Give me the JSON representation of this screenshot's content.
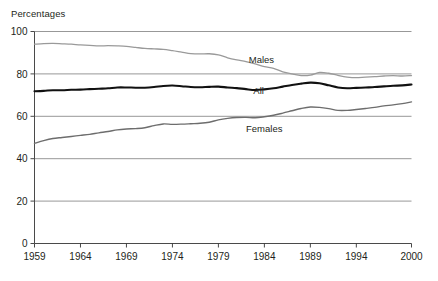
{
  "chart_data": {
    "type": "line",
    "title": "",
    "subtitle": "",
    "ylabel": "Percentages",
    "xlabel": "",
    "ylim": [
      0,
      100
    ],
    "xlim": [
      1959,
      2000
    ],
    "yticks": [
      0,
      20,
      40,
      60,
      80,
      100
    ],
    "ytick_labels": [
      "0",
      "20",
      "40",
      "60",
      "80",
      "100"
    ],
    "xticks": [
      1959,
      1964,
      1969,
      1974,
      1979,
      1984,
      1989,
      1994,
      2000
    ],
    "xtick_labels": [
      "1959",
      "1964",
      "1969",
      "1974",
      "1979",
      "1984",
      "1989",
      "1994",
      "2000"
    ],
    "grid": "horizontal",
    "legend": "inline-labels",
    "x": [
      1959,
      1960,
      1961,
      1962,
      1963,
      1964,
      1965,
      1966,
      1967,
      1968,
      1969,
      1970,
      1971,
      1972,
      1973,
      1974,
      1975,
      1976,
      1977,
      1978,
      1979,
      1980,
      1981,
      1982,
      1983,
      1984,
      1985,
      1986,
      1987,
      1988,
      1989,
      1990,
      1991,
      1992,
      1993,
      1994,
      1995,
      1996,
      1997,
      1998,
      1999,
      2000
    ],
    "series": [
      {
        "name": "Males",
        "color": "#9a9a9a",
        "width": 1.3,
        "values": [
          94.0,
          94.3,
          94.4,
          94.2,
          94.0,
          93.7,
          93.5,
          93.2,
          93.3,
          93.2,
          93.0,
          92.5,
          92.0,
          91.8,
          91.6,
          91.0,
          90.3,
          89.6,
          89.4,
          89.5,
          89.0,
          87.6,
          86.6,
          85.8,
          84.7,
          83.4,
          82.6,
          81.0,
          80.0,
          79.2,
          79.4,
          80.7,
          80.3,
          79.3,
          78.5,
          78.2,
          78.5,
          78.7,
          79.0,
          79.2,
          79.0,
          79.2
        ]
      },
      {
        "name": "All",
        "color": "#111111",
        "width": 2.1,
        "values": [
          71.8,
          72.0,
          72.3,
          72.3,
          72.5,
          72.6,
          72.8,
          73.0,
          73.2,
          73.6,
          73.6,
          73.5,
          73.5,
          73.8,
          74.3,
          74.5,
          74.2,
          73.8,
          73.7,
          73.9,
          74.0,
          73.6,
          73.3,
          72.8,
          72.4,
          72.7,
          73.2,
          74.0,
          74.8,
          75.4,
          75.9,
          75.6,
          74.6,
          73.6,
          73.2,
          73.4,
          73.6,
          73.8,
          74.1,
          74.4,
          74.6,
          75.0
        ]
      },
      {
        "name": "Females",
        "color": "#6d6d6d",
        "width": 1.4,
        "values": [
          47.2,
          48.5,
          49.5,
          50.0,
          50.5,
          51.0,
          51.5,
          52.2,
          52.8,
          53.6,
          54.0,
          54.2,
          54.6,
          55.6,
          56.4,
          56.2,
          56.3,
          56.5,
          56.7,
          57.2,
          58.3,
          59.0,
          59.4,
          59.5,
          59.3,
          59.8,
          60.5,
          61.5,
          62.6,
          63.7,
          64.4,
          64.2,
          63.6,
          62.8,
          62.8,
          63.2,
          63.7,
          64.2,
          64.9,
          65.4,
          66.0,
          66.8
        ]
      }
    ],
    "inline_labels": [
      {
        "name": "Males",
        "text": "Males",
        "x": 1982.3,
        "y": 85.0
      },
      {
        "name": "All",
        "text": "All",
        "x": 1982.8,
        "y": 70.3
      },
      {
        "name": "Females",
        "text": "Females",
        "x": 1982.0,
        "y": 52.8
      }
    ]
  }
}
